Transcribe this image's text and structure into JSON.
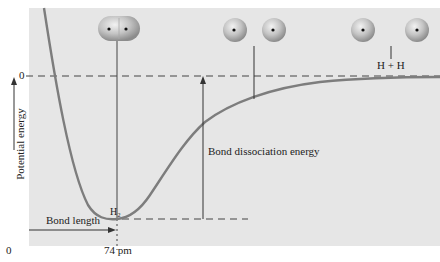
{
  "diagram": {
    "title": "",
    "axes": {
      "y_label": "Potential energy",
      "y_zero_label": "0",
      "x_origin_label": "0",
      "x_tick_label": "74 pm"
    },
    "annotations": {
      "molecule_label": "H₂",
      "bond_length": "Bond length",
      "bond_dissociation": "Bond dissociation energy",
      "separated_atoms": "H + H"
    },
    "illustrations": [
      {
        "name": "h2-molecule",
        "atoms": 2,
        "bonded": true
      },
      {
        "name": "h-atoms-approaching",
        "atoms": 2,
        "bonded": false
      },
      {
        "name": "h-atoms-separated",
        "atoms": 2,
        "bonded": false
      }
    ],
    "colors": {
      "panel": "#e4e4e4",
      "curve": "#7a7a7a",
      "lines": "#333333",
      "atom": "#b8b8b8"
    }
  }
}
